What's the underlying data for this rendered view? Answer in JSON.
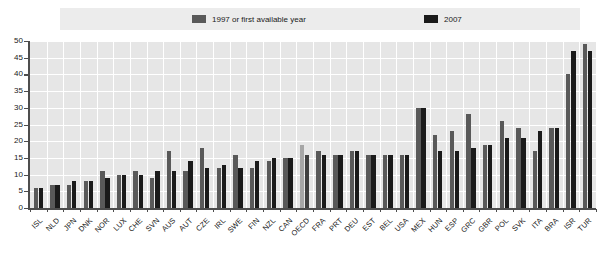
{
  "legend": {
    "items": [
      {
        "label": "1997 or first available year",
        "color": "#595959",
        "name": "series-1997"
      },
      {
        "label": "2007",
        "color": "#1a1a1a",
        "name": "series-2007"
      }
    ]
  },
  "axis": {
    "y_ticks": [
      "50",
      "45",
      "40",
      "35",
      "30",
      "25",
      "20",
      "15",
      "10",
      "5",
      "0"
    ]
  },
  "chart_data": {
    "type": "bar",
    "title": "",
    "subtitle": "",
    "xlabel": "",
    "ylabel": "",
    "ylim": [
      0,
      50
    ],
    "ytick_step": 5,
    "grid": true,
    "legend_position": "top",
    "highlight_category": "OECD",
    "highlight_colors": {
      "s1997": "#a6a6a6",
      "s2007": "#404040"
    },
    "series_colors": {
      "s1997": "#595959",
      "s2007": "#1a1a1a"
    },
    "categories": [
      "ISL",
      "NLD",
      "JPN",
      "DNK",
      "NOR",
      "LUX",
      "CHE",
      "SVN",
      "AUS",
      "AUT",
      "CZE",
      "IRL",
      "SWE",
      "FIN",
      "NZL",
      "CAN",
      "OECD",
      "FRA",
      "PRT",
      "DEU",
      "EST",
      "BEL",
      "USA",
      "MEX",
      "HUN",
      "ESP",
      "GRC",
      "GBR",
      "POL",
      "SVK",
      "ITA",
      "BRA",
      "ISR",
      "TUR"
    ],
    "series": [
      {
        "name": "1997 or first available year",
        "values": [
          6,
          7,
          7,
          8,
          11,
          10,
          11,
          9,
          17,
          11,
          18,
          12,
          16,
          12,
          14,
          15,
          19,
          17,
          16,
          17,
          16,
          16,
          16,
          30,
          22,
          23,
          28,
          19,
          26,
          24,
          17,
          24,
          40,
          49
        ]
      },
      {
        "name": "2007",
        "values": [
          6,
          7,
          8,
          8,
          9,
          10,
          10,
          11,
          11,
          14,
          12,
          13,
          12,
          14,
          15,
          15,
          16,
          16,
          16,
          17,
          16,
          16,
          16,
          30,
          17,
          17,
          18,
          19,
          21,
          21,
          23,
          24,
          47,
          47
        ]
      }
    ]
  }
}
